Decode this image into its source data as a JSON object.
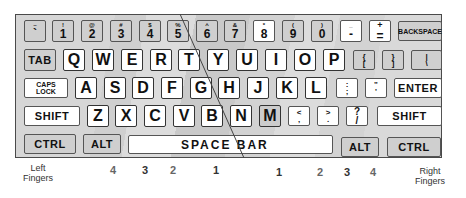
{
  "diagram": {
    "colors": {
      "key_gray": "#cfcfcf",
      "key_white": "#ffffff",
      "border": "#4a4a4a",
      "divider": "#444444"
    },
    "rows": {
      "number_row": [
        {
          "top": "~",
          "bottom": "`"
        },
        {
          "top": "!",
          "bottom": "1"
        },
        {
          "top": "@",
          "bottom": "2"
        },
        {
          "top": "#",
          "bottom": "3"
        },
        {
          "top": "$",
          "bottom": "4"
        },
        {
          "top": "%",
          "bottom": "5"
        },
        {
          "top": "^",
          "bottom": "6"
        },
        {
          "top": "&",
          "bottom": "7"
        },
        {
          "top": "*",
          "bottom": "8"
        },
        {
          "top": "(",
          "bottom": "9"
        },
        {
          "top": ")",
          "bottom": "0"
        },
        {
          "top": "_",
          "bottom": "-"
        },
        {
          "top": "+",
          "bottom": "="
        },
        {
          "label": "BACKSPACE"
        }
      ],
      "top_row": [
        {
          "label": "TAB"
        },
        {
          "label": "Q"
        },
        {
          "label": "W"
        },
        {
          "label": "E"
        },
        {
          "label": "R"
        },
        {
          "label": "T"
        },
        {
          "label": "Y"
        },
        {
          "label": "U"
        },
        {
          "label": "I"
        },
        {
          "label": "O"
        },
        {
          "label": "P"
        },
        {
          "top": "{",
          "bottom": "["
        },
        {
          "top": "}",
          "bottom": "]"
        },
        {
          "top": "|",
          "bottom": "\\"
        }
      ],
      "home_row": [
        {
          "label_line1": "CAPS",
          "label_line2": "LOCK"
        },
        {
          "label": "A"
        },
        {
          "label": "S"
        },
        {
          "label": "D"
        },
        {
          "label": "F"
        },
        {
          "label": "G"
        },
        {
          "label": "H"
        },
        {
          "label": "J"
        },
        {
          "label": "K"
        },
        {
          "label": "L"
        },
        {
          "top": ":",
          "bottom": ";"
        },
        {
          "top": "\"",
          "bottom": "'"
        },
        {
          "label": "ENTER"
        }
      ],
      "bottom_row": [
        {
          "label": "SHIFT"
        },
        {
          "label": "Z"
        },
        {
          "label": "X"
        },
        {
          "label": "C"
        },
        {
          "label": "V"
        },
        {
          "label": "B"
        },
        {
          "label": "N"
        },
        {
          "label": "M"
        },
        {
          "top": "<",
          "bottom": ","
        },
        {
          "top": ">",
          "bottom": "."
        },
        {
          "top": "?",
          "bottom": "/"
        },
        {
          "label": "SHIFT"
        }
      ],
      "space_row": [
        {
          "label": "CTRL"
        },
        {
          "label": "ALT"
        },
        {
          "label": "SPACE BAR"
        },
        {
          "label": "ALT"
        },
        {
          "label": "CTRL"
        }
      ]
    },
    "fingers": {
      "left_label_line1": "Left",
      "left_label_line2": "Fingers",
      "right_label_line1": "Right",
      "right_label_line2": "Fingers",
      "left": [
        "4",
        "3",
        "2",
        "1"
      ],
      "right": [
        "1",
        "2",
        "3",
        "4"
      ]
    }
  }
}
